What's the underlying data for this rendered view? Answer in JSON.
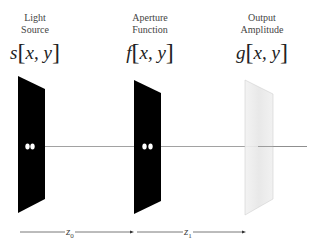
{
  "diagram": {
    "type": "optical-propagation",
    "planes": [
      {
        "id": "source",
        "title_line1": "Light",
        "title_line2": "Source",
        "func": "s",
        "args": "x, y",
        "fill": "#000000"
      },
      {
        "id": "aperture",
        "title_line1": "Aperture",
        "title_line2": "Function",
        "func": "f",
        "args": "x, y",
        "fill": "#000000"
      },
      {
        "id": "output",
        "title_line1": "Output",
        "title_line2": "Amplitude",
        "func": "g",
        "args": "x, y",
        "fill": "#ececec"
      }
    ],
    "distances": [
      {
        "symbol": "z",
        "subscript": "0"
      },
      {
        "symbol": "z",
        "subscript": "1"
      }
    ],
    "colors": {
      "axis": "#8a8a8a",
      "arrow": "#555555",
      "panel_dark": "#000000",
      "panel_light": "#ececec",
      "panel_light_edge": "#d0d0d0",
      "dot": "#ffffff"
    }
  }
}
